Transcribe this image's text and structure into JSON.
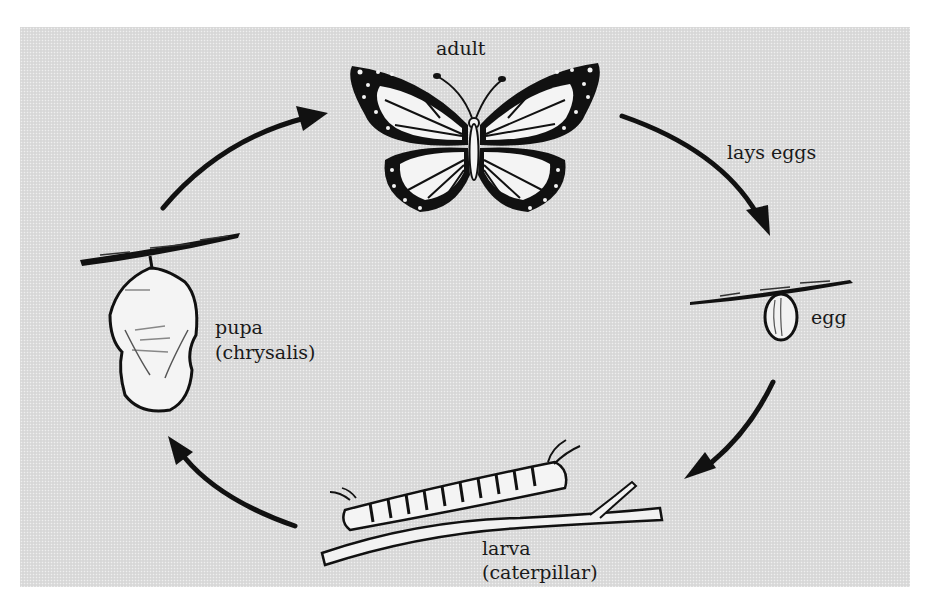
{
  "diagram": {
    "background_color": "#dcdcdc",
    "ink_color": "#111111",
    "stages": [
      {
        "id": "adult",
        "label": "adult",
        "sublabel": ""
      },
      {
        "id": "egg",
        "label": "egg",
        "sublabel": ""
      },
      {
        "id": "larva",
        "label": "larva",
        "sublabel": "(caterpillar)"
      },
      {
        "id": "pupa",
        "label": "pupa",
        "sublabel": "(chrysalis)"
      }
    ],
    "transitions": [
      {
        "from": "adult",
        "to": "egg",
        "label": "lays eggs"
      },
      {
        "from": "egg",
        "to": "larva",
        "label": ""
      },
      {
        "from": "larva",
        "to": "pupa",
        "label": ""
      },
      {
        "from": "pupa",
        "to": "adult",
        "label": ""
      }
    ]
  }
}
